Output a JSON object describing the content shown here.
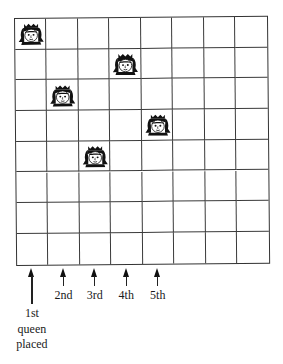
{
  "board": {
    "rows": 8,
    "cols": 8,
    "queens": [
      {
        "order": "1st",
        "row": 0,
        "col": 0
      },
      {
        "order": "2nd",
        "row": 2,
        "col": 1
      },
      {
        "order": "3rd",
        "row": 4,
        "col": 2
      },
      {
        "order": "4th",
        "row": 1,
        "col": 3
      },
      {
        "order": "5th",
        "row": 3,
        "col": 4
      }
    ],
    "queen_icon": "queen-face-icon",
    "line_color": "#3a3a3a"
  },
  "labels": [
    {
      "col": 0,
      "lines": [
        "1st",
        "queen",
        "placed"
      ]
    },
    {
      "col": 1,
      "lines": [
        "2nd"
      ]
    },
    {
      "col": 2,
      "lines": [
        "3rd"
      ]
    },
    {
      "col": 3,
      "lines": [
        "4th"
      ]
    },
    {
      "col": 4,
      "lines": [
        "5th"
      ]
    }
  ]
}
